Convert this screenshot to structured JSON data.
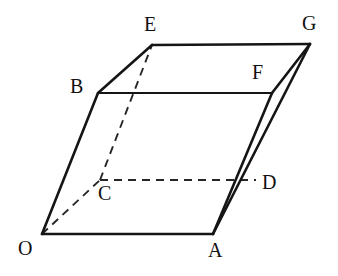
{
  "figure": {
    "type": "3d-solid-line-drawing",
    "shape": "parallelepiped",
    "background_color": "#ffffff",
    "stroke_color": "#151515",
    "dashed_stroke_color": "#262626",
    "canvas": {
      "width": 338,
      "height": 276
    },
    "vertices": [
      {
        "id": "O",
        "label": "O",
        "x": 42,
        "y": 234,
        "label_x": 18,
        "label_y": 238,
        "hidden": false
      },
      {
        "id": "A",
        "label": "A",
        "x": 213,
        "y": 234,
        "label_x": 210,
        "label_y": 240,
        "hidden": false
      },
      {
        "id": "B",
        "label": "B",
        "x": 98,
        "y": 93,
        "label_x": 72,
        "label_y": 76,
        "hidden": false
      },
      {
        "id": "C",
        "label": "C",
        "x": 100,
        "y": 180,
        "label_x": 98,
        "label_y": 183,
        "hidden": true
      },
      {
        "id": "D",
        "label": "D",
        "x": 256,
        "y": 180,
        "label_x": 262,
        "label_y": 173,
        "hidden": true
      },
      {
        "id": "E",
        "label": "E",
        "x": 152,
        "y": 45,
        "label_x": 145,
        "label_y": 15,
        "hidden": false
      },
      {
        "id": "F",
        "label": "F",
        "x": 272,
        "y": 93,
        "label_x": 253,
        "label_y": 63,
        "hidden": false
      },
      {
        "id": "G",
        "label": "G",
        "x": 310,
        "y": 44,
        "label_x": 303,
        "label_y": 14,
        "hidden": false
      }
    ],
    "edges_solid": [
      {
        "name": "O-A",
        "from": "O",
        "to": "A"
      },
      {
        "name": "O-B",
        "from": "O",
        "to": "B"
      },
      {
        "name": "B-E",
        "from": "B",
        "to": "E"
      },
      {
        "name": "B-F",
        "from": "B",
        "to": "F"
      },
      {
        "name": "E-G",
        "from": "E",
        "to": "G"
      },
      {
        "name": "F-G",
        "from": "F",
        "to": "G"
      },
      {
        "name": "A-F",
        "from": "A",
        "to": "F"
      },
      {
        "name": "A-G",
        "from": "A",
        "to": "G"
      }
    ],
    "edges_dashed": [
      {
        "name": "O-C",
        "from": "O",
        "to": "C"
      },
      {
        "name": "C-E",
        "from": "C",
        "to": "E"
      },
      {
        "name": "C-D",
        "from": "C",
        "to": "D"
      }
    ]
  }
}
